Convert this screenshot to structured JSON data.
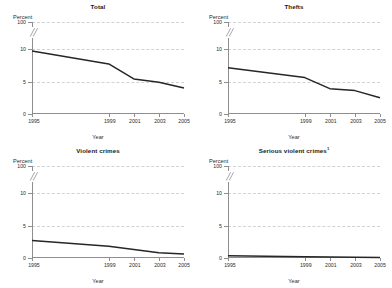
{
  "figure": {
    "background_color": "#ffffff",
    "line_color": "#262626",
    "grid_color": "#d2d2d2",
    "axis_color": "#8e8e8e",
    "layout": "2x2 grid of small multiples"
  },
  "axes": {
    "ylabel": "Percent",
    "xlabel": "Year",
    "y_ticks": [
      "0",
      "5",
      "10",
      "100"
    ],
    "y_tick_values": [
      0,
      5,
      10,
      100
    ],
    "y_axis_broken": true,
    "y_break_note": "axis break between 10 and 100",
    "x_ticks": [
      "1995",
      "1999",
      "2001",
      "2003",
      "2005"
    ],
    "x_tick_values": [
      1995,
      1999,
      2001,
      2003,
      2005
    ],
    "grid": "horizontal dashed gridlines at 5, 10 and 100"
  },
  "chart_data": [
    {
      "type": "line",
      "title": "Total",
      "xlabel": "Year",
      "ylabel": "Percent",
      "x": [
        1995,
        1999,
        2001,
        2003,
        2005
      ],
      "values": [
        9.7,
        7.7,
        5.4,
        4.9,
        4.0
      ],
      "ylim": [
        0,
        100
      ],
      "y_ticks": [
        0,
        5,
        10,
        100
      ],
      "broken_axis": true,
      "grid": true,
      "legend": "none"
    },
    {
      "type": "line",
      "title": "Thefts",
      "xlabel": "Year",
      "ylabel": "Percent",
      "x": [
        1995,
        1999,
        2001,
        2003,
        2005
      ],
      "values": [
        7.1,
        5.6,
        3.9,
        3.6,
        2.5
      ],
      "ylim": [
        0,
        100
      ],
      "y_ticks": [
        0,
        5,
        10,
        100
      ],
      "broken_axis": true,
      "grid": true,
      "legend": "none"
    },
    {
      "type": "line",
      "title": "Violent crimes",
      "xlabel": "Year",
      "ylabel": "Percent",
      "x": [
        1995,
        1999,
        2001,
        2003,
        2005
      ],
      "values": [
        2.7,
        1.8,
        1.3,
        0.8,
        0.6
      ],
      "ylim": [
        0,
        100
      ],
      "y_ticks": [
        0,
        5,
        10,
        100
      ],
      "broken_axis": true,
      "grid": true,
      "legend": "none"
    },
    {
      "type": "line",
      "title": "Serious violent crimes",
      "title_footnote": "1",
      "xlabel": "Year",
      "ylabel": "Percent",
      "x": [
        1995,
        1999,
        2001,
        2003,
        2005
      ],
      "values": [
        0.35,
        0.2,
        0.15,
        0.1,
        0.08
      ],
      "ylim": [
        0,
        100
      ],
      "y_ticks": [
        0,
        5,
        10,
        100
      ],
      "broken_axis": true,
      "grid": true,
      "legend": "none"
    }
  ]
}
